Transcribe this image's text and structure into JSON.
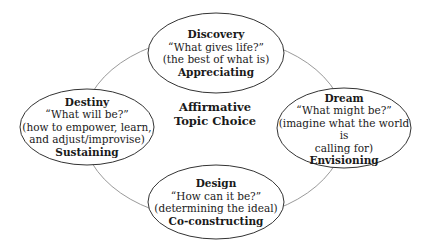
{
  "center": {
    "line1": "Affirmative",
    "line2": "Topic Choice"
  },
  "nodes": {
    "discovery": {
      "title": "Discovery",
      "question": "“What gives life?”",
      "description": "(the best of what is)",
      "verb": "Appreciating"
    },
    "dream": {
      "title": "Dream",
      "question": "“What might be?”",
      "description_line1": "(imagine what the world is",
      "description_line2": "calling for)",
      "verb": "Envisioning"
    },
    "design": {
      "title": "Design",
      "question": "“How can it be?”",
      "description": "(determining the ideal)",
      "verb": "Co-constructing"
    },
    "destiny": {
      "title": "Destiny",
      "question": "“What will be?”",
      "description_line1": "(how to empower, learn,",
      "description_line2": "and adjust/improvise)",
      "verb": "Sustaining"
    }
  },
  "colors": {
    "ellipse_stroke": "#333333",
    "cycle_stroke": "#9a9a9a",
    "text": "#1a1a1a"
  }
}
